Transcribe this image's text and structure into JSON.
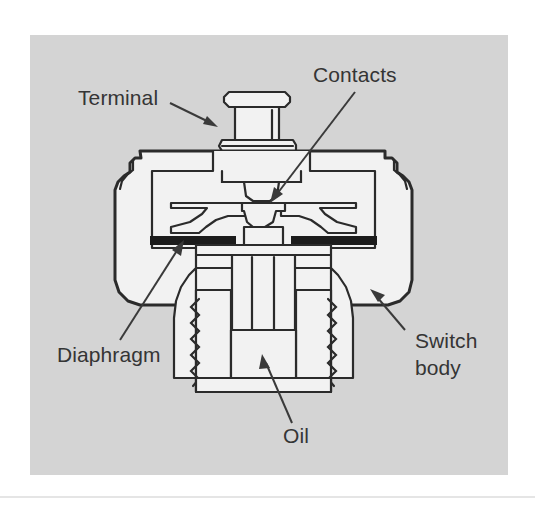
{
  "figure": {
    "title": "Oil pressure switch cutaway diagram",
    "panel": {
      "background_color": "#d4d4d4",
      "page_color": "#ffffff",
      "x": 30,
      "y": 35,
      "width": 478,
      "height": 440
    },
    "footer_rule": {
      "color": "#dcdcdc",
      "y": 497
    },
    "line_color": "#2b2b2b",
    "fill_color": "#f2f2f2",
    "shade_color": "#1c1c1c",
    "text_color": "#353535"
  },
  "labels": [
    {
      "id": "terminal",
      "text": "Terminal",
      "x": 78,
      "y": 105,
      "anchor": "start",
      "leader": {
        "x1": 170,
        "y1": 103,
        "x2": 214,
        "y2": 124
      },
      "arrow_angle": 26
    },
    {
      "id": "contacts",
      "text": "Contacts",
      "x": 313,
      "y": 82,
      "anchor": "start",
      "leader": {
        "x1": 355,
        "y1": 92,
        "x2": 272,
        "y2": 200
      },
      "arrow_angle": 232
    },
    {
      "id": "diaphragm",
      "text": "Diaphragm",
      "x": 57,
      "y": 362,
      "anchor": "start",
      "leader": {
        "x1": 120,
        "y1": 340,
        "x2": 182,
        "y2": 243
      },
      "arrow_angle": 302
    },
    {
      "id": "switch-body",
      "text": "Switch",
      "text2": "body",
      "x": 415,
      "y": 348,
      "anchor": "start",
      "leader": {
        "x1": 405,
        "y1": 330,
        "x2": 372,
        "y2": 292
      },
      "arrow_angle": 229
    },
    {
      "id": "oil",
      "text": "Oil",
      "x": 283,
      "y": 443,
      "anchor": "start",
      "leader": {
        "x1": 292,
        "y1": 423,
        "x2": 262,
        "y2": 357
      },
      "arrow_angle": 246
    }
  ],
  "parts": [
    {
      "id": "terminal-post",
      "name": "Terminal"
    },
    {
      "id": "contact-disc",
      "name": "Contacts"
    },
    {
      "id": "diaphragm-band",
      "name": "Diaphragm"
    },
    {
      "id": "switch-housing",
      "name": "Switch body"
    },
    {
      "id": "oil-chamber",
      "name": "Oil"
    },
    {
      "id": "threaded-nipple",
      "name": "Threaded nipple"
    },
    {
      "id": "plunger-stem",
      "name": "Plunger stem"
    }
  ]
}
